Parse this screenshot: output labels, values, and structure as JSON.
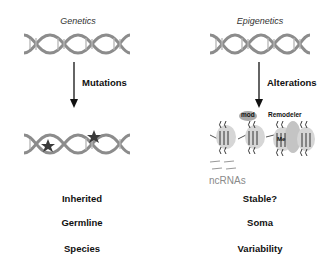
{
  "left": {
    "title": "Genetics",
    "arrow_label": "Mutations",
    "rows": [
      "Inherited",
      "Germline",
      "Species"
    ]
  },
  "right": {
    "title": "Epigenetics",
    "arrow_label": "Alterations",
    "nucleosome_labels": {
      "mod": "mod",
      "remodeler": "Remodeler",
      "me": "Me"
    },
    "ncrna_label": "ncRNAs",
    "rows": [
      "Stable?",
      "Soma",
      "Variability"
    ]
  },
  "colors": {
    "dna": "#8c8c8c",
    "arrow": "#111111",
    "star": "#3a3a3a",
    "nucleosome": "#cfcfcf"
  }
}
